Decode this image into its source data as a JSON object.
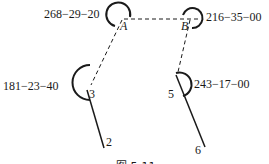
{
  "figure": {
    "points": {
      "A": "A",
      "B": "B",
      "p2": "2",
      "p3": "3",
      "p5": "5",
      "p6": "6"
    },
    "angles": {
      "A": "268−29−20",
      "B": "216−35−00",
      "p3": "181−23−40",
      "p5": "243−17−00"
    },
    "caption": "图 5-11"
  }
}
